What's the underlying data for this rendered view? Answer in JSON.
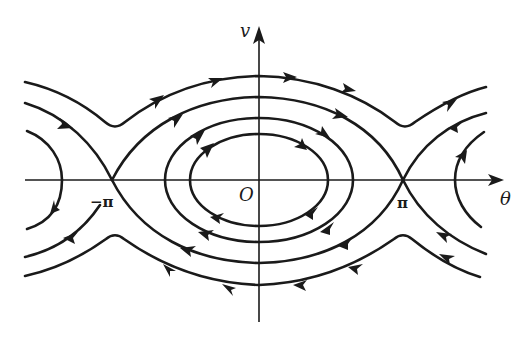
{
  "figure": {
    "type": "phase-portrait",
    "labels": {
      "y_axis": "v",
      "x_axis": "θ",
      "origin": "O",
      "neg_pi": "−π",
      "pos_pi": "π"
    },
    "colors": {
      "stroke": "#1a1a1a",
      "background": "#ffffff"
    },
    "saddle_points": [
      "−π",
      "π"
    ],
    "center_point": "O"
  }
}
